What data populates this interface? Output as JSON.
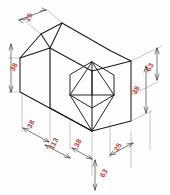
{
  "drawing": {
    "title": "Isometric view of chamfered block with hexagonal pyramid recess",
    "projection": "isometric",
    "units": "mm",
    "line_color": "#1a1a1a",
    "dimension_text_color": "#b4443c",
    "extension_line_color": "#9a9a9a",
    "background_color": "#fefefe"
  },
  "dimensions": [
    {
      "id": "top-chamfer-width",
      "value": "25",
      "position": "top-left",
      "orientation": "iso-right",
      "rotation": -62
    },
    {
      "id": "left-chamfer-height",
      "value": "38",
      "position": "left-upper",
      "orientation": "vertical",
      "rotation": -62
    },
    {
      "id": "bottom-left-first",
      "value": "38",
      "position": "bottom-left",
      "orientation": "iso-left",
      "rotation": -62
    },
    {
      "id": "bottom-overall",
      "value": "113",
      "position": "bottom-center-left",
      "orientation": "iso-left",
      "rotation": -62
    },
    {
      "id": "bottom-left-last",
      "value": "38",
      "position": "bottom-center",
      "orientation": "iso-left",
      "rotation": -62
    },
    {
      "id": "bottom-depth",
      "value": "63",
      "position": "bottom-center-low",
      "orientation": "vertical",
      "rotation": -62
    },
    {
      "id": "bottom-right-near",
      "value": "25",
      "position": "bottom-right",
      "orientation": "iso-right",
      "rotation": -62
    },
    {
      "id": "right-upper-height",
      "value": "63",
      "position": "right-upper",
      "orientation": "vertical",
      "rotation": -62
    },
    {
      "id": "right-lower-height",
      "value": "38",
      "position": "right-middle",
      "orientation": "vertical",
      "rotation": -62
    }
  ],
  "features": {
    "hexagon_recess": {
      "label": "hexagonal recess with pyramid apex",
      "sides": 6,
      "internal_edges": 5
    },
    "chamfer": {
      "label": "top-left corner chamfer"
    }
  }
}
